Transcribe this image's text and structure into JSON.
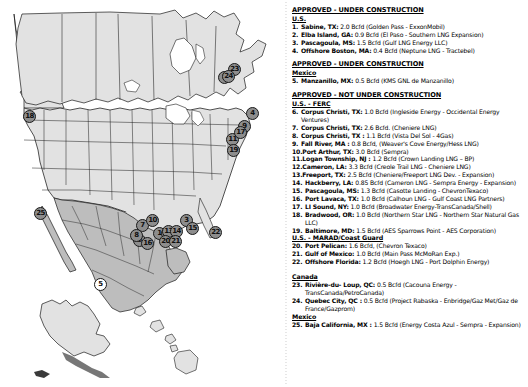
{
  "map": {
    "title": "north-america-lng-terminal-map",
    "region_fill": "#e2e2e2",
    "mexico_fill": "#bdbdbd",
    "outline": "#1a1a1a",
    "marker_fill": "#8d8d8d",
    "markers": [
      {
        "n": "1",
        "x": 159,
        "y": 233,
        "style": "gray"
      },
      {
        "n": "2",
        "x": 224,
        "y": 77,
        "style": "gray"
      },
      {
        "n": "3",
        "x": 186,
        "y": 220,
        "style": "gray"
      },
      {
        "n": "4",
        "x": 252,
        "y": 113,
        "style": "gray"
      },
      {
        "n": "5",
        "x": 100,
        "y": 284,
        "style": "white"
      },
      {
        "n": "6",
        "x": 139,
        "y": 240,
        "style": "gray"
      },
      {
        "n": "7",
        "x": 142,
        "y": 225,
        "style": "gray"
      },
      {
        "n": "8",
        "x": 136,
        "y": 235,
        "style": "gray"
      },
      {
        "n": "9",
        "x": 244,
        "y": 126,
        "style": "gray"
      },
      {
        "n": "10",
        "x": 152,
        "y": 220,
        "style": "gray"
      },
      {
        "n": "11",
        "x": 232,
        "y": 139,
        "style": "gray"
      },
      {
        "n": "12",
        "x": 167,
        "y": 233,
        "style": "gray"
      },
      {
        "n": "13",
        "x": 168,
        "y": 231,
        "style": "gray"
      },
      {
        "n": "14",
        "x": 176,
        "y": 231,
        "style": "gray"
      },
      {
        "n": "15",
        "x": 192,
        "y": 228,
        "style": "gray"
      },
      {
        "n": "16",
        "x": 147,
        "y": 243,
        "style": "gray"
      },
      {
        "n": "17",
        "x": 240,
        "y": 132,
        "style": "gray"
      },
      {
        "n": "18",
        "x": 29,
        "y": 116,
        "style": "gray"
      },
      {
        "n": "19",
        "x": 233,
        "y": 150,
        "style": "gray"
      },
      {
        "n": "20",
        "x": 165,
        "y": 241,
        "style": "gray"
      },
      {
        "n": "21",
        "x": 175,
        "y": 241,
        "style": "gray"
      },
      {
        "n": "22",
        "x": 215,
        "y": 232,
        "style": "gray"
      },
      {
        "n": "23",
        "x": 234,
        "y": 69,
        "style": "gray"
      },
      {
        "n": "24",
        "x": 228,
        "y": 76,
        "style": "gray"
      },
      {
        "n": "25",
        "x": 40,
        "y": 213,
        "style": "gray"
      }
    ]
  },
  "legend": {
    "sections": [
      {
        "heading": "APPROVED - UNDER CONSTRUCTION",
        "subgroups": [
          {
            "label": "U.S.",
            "entries": [
              {
                "num": "1.",
                "loc": "Sabine, TX:",
                "det": "2.0 Bcfd (Golden Pass - ExxonMobil)"
              },
              {
                "num": "2.",
                "loc": "Elba Island, GA:",
                "det": "0.9 Bcfd (El Paso - Southern LNG Expansion)"
              },
              {
                "num": "3.",
                "loc": "Pascagoula, MS:",
                "det": "1.5 Bcfd (Gulf LNG Energy LLC)"
              },
              {
                "num": "4.",
                "loc": "Offshore Boston, MA:",
                "det": "0.4 Bcfd (Neptune LNG - Tractebel)"
              }
            ]
          }
        ]
      },
      {
        "heading": "APPROVED - UNDER CONSTRUCTION",
        "subgroups": [
          {
            "label": "Mexico",
            "entries": [
              {
                "num": "5.",
                "loc": "Manzanillo, MX:",
                "det": "0.5 Bcfd (KMS GNL de Manzanillo)"
              }
            ]
          }
        ]
      },
      {
        "heading": "APPROVED - NOT UNDER CONSTRUCTION",
        "subgroups": [
          {
            "label": "U.S. - FERC",
            "entries": [
              {
                "num": "6.",
                "loc": "Corpus Christi, TX:",
                "det": "1.0 Bcfd (Ingleside Energy - Occidental Energy Ventures)"
              },
              {
                "num": "7.",
                "loc": "Corpus Christi, TX:",
                "det": "2.6 Bcfd. (Cheniere LNG)"
              },
              {
                "num": "8.",
                "loc": "Corpus Christi, TX :",
                "det": "1.1 Bcfd (Vista Del Sol - 4Gas)"
              },
              {
                "num": "9.",
                "loc": "Fall River, MA :",
                "det": "0.8 Bcfd, (Weaver's Cove Energy/Hess LNG)"
              },
              {
                "num": "10.",
                "loc": "Port Arthur, TX:",
                "det": "3.0 Bcfd (Sempra)"
              },
              {
                "num": "11.",
                "loc": "Logan Township, NJ :",
                "det": "1.2 Bcfd (Crown Landing LNG – BP)"
              },
              {
                "num": "12.",
                "loc": "Cameron, LA:",
                "det": "3.3 Bcfd (Creole Trail LNG - Cheniere LNG)"
              },
              {
                "num": "13.",
                "loc": "Freeport, TX:",
                "det": "2.5 Bcfd (Cheniere/Freeport LNG Dev. - Expansion)"
              },
              {
                "num": "14.",
                "loc": "Hackberry, LA:",
                "det": "0.85 Bcfd  (Cameron LNG - Sempra Energy - Expansion)",
                "indent": true
              },
              {
                "num": "15.",
                "loc": "Pascagoula, MS:",
                "det": "1.3 Bcfd (Casotte Landing - ChevronTexaco)",
                "indent": true
              },
              {
                "num": "16.",
                "loc": "Port Lavaca, TX:",
                "det": "1.0 Bcfd (Calhoun LNG - Gulf Coast LNG Partners)",
                "indent": true
              },
              {
                "num": "17.",
                "loc": "LI Sound, NY:",
                "det": "1.0 Bcfd (Broadwater Energy-TransCanada/Shell)",
                "indent": true
              },
              {
                "num": "18.",
                "loc": "Bradwood, OR:",
                "det": "1.0 Bcfd (Northern Star LNG - Northern Star Natural Gas LLC)",
                "indent": true
              },
              {
                "num": "19.",
                "loc": "Baltimore, MD:",
                "det": "1.5 Bcfd (AES Sparrows Point - AES Corporation)",
                "indent": true
              }
            ]
          },
          {
            "label": "U.S. - MARAD/Coast Guard",
            "entries": [
              {
                "num": "20.",
                "loc": "Port Pelican:",
                "det": "1.6 Bcfd,  (Chevron Texaco)",
                "indent": true
              },
              {
                "num": "21.",
                "loc": "Gulf of Mexico:",
                "det": "1.0 Bcfd (Main Pass McMoRan Exp.)",
                "indent": true
              },
              {
                "num": "22.",
                "loc": "Offshore Florida:",
                "det": "1.2 Bcfd (Hoegh LNG - Port Dolphin Energy)",
                "indent": true
              }
            ]
          }
        ]
      },
      {
        "heading": "",
        "subgroups": [
          {
            "label": "Canada",
            "entries": [
              {
                "num": "23.",
                "loc": "Rivière-du- Loup, QC:",
                "det": "0.5 Bcfd (Cacouna Energy - TransCanada/PetroCanada)",
                "indent": true
              },
              {
                "num": "24.",
                "loc": "Quebec City, QC :",
                "det": "0.5 Bcfd (Project Rabaska - Enbridge/Gaz Met/Gaz de France/Gazprom)",
                "indent": true
              }
            ]
          },
          {
            "label": "Mexico",
            "entries": [
              {
                "num": "25.",
                "loc": "Baja California, MX :",
                "det": "1.5 Bcfd  (Energy Costa Azul - Sempra - Expansion)",
                "indent": true
              }
            ]
          }
        ]
      }
    ]
  }
}
